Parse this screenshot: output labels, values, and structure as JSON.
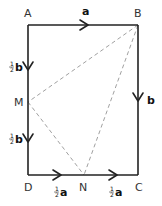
{
  "diagram": {
    "type": "vector-rectangle",
    "points": {
      "A": {
        "label": "A",
        "x": 28,
        "y": 25
      },
      "B": {
        "label": "B",
        "x": 138,
        "y": 25
      },
      "C": {
        "label": "C",
        "x": 138,
        "y": 175
      },
      "D": {
        "label": "D",
        "x": 28,
        "y": 175
      },
      "M": {
        "label": "M",
        "x": 28,
        "y": 102
      },
      "N": {
        "label": "N",
        "x": 84,
        "y": 175
      }
    },
    "edges": {
      "AB": {
        "vector": "a"
      },
      "AM": {
        "coef_num": "1",
        "coef_den": "2",
        "vector": "b"
      },
      "MD": {
        "coef_num": "1",
        "coef_den": "2",
        "vector": "b"
      },
      "BC": {
        "vector": "b"
      },
      "DN": {
        "coef_num": "1",
        "coef_den": "2",
        "vector": "a"
      },
      "NC": {
        "coef_num": "1",
        "coef_den": "2",
        "vector": "a"
      }
    },
    "dashed_lines": [
      "BM",
      "BN",
      "MN"
    ],
    "colors": {
      "solid": "#222222",
      "dashed": "#888888",
      "label": "#333333"
    }
  }
}
